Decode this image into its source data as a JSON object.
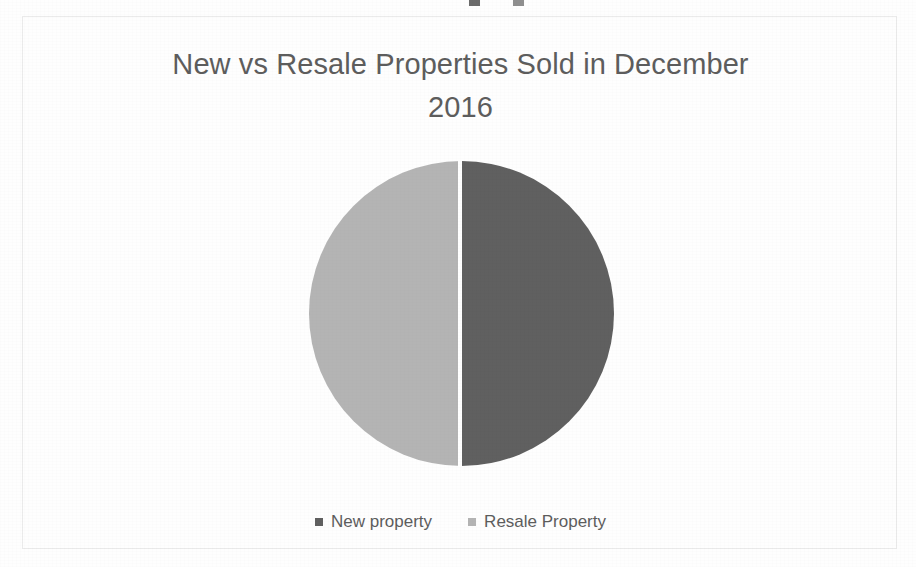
{
  "page": {
    "background_color": "#fefefe",
    "frame_border_color": "#ebebeb"
  },
  "top_cutoff": {
    "name": "cut-off-legend-markers",
    "markers": [
      {
        "color": "#6b6b6b",
        "left": 469
      },
      {
        "color": "#8f8f8f",
        "left": 513
      }
    ]
  },
  "chart_data": {
    "type": "pie",
    "title": "New vs Resale Properties Sold in December 2016",
    "title_lines": [
      "New vs Resale Properties Sold in December",
      "2016"
    ],
    "categories": [
      "New property",
      "Resale Property"
    ],
    "values": [
      50,
      50
    ],
    "value_unit": "percent",
    "colors": [
      "#606060",
      "#b4b4b4"
    ],
    "slices": [
      {
        "label": "New property",
        "value": 50,
        "color": "#606060",
        "position": "right-half"
      },
      {
        "label": "Resale Property",
        "value": 50,
        "color": "#b4b4b4",
        "position": "left-half"
      }
    ],
    "legend": {
      "position": "bottom",
      "entries": [
        {
          "label": "New property",
          "color": "#606060"
        },
        {
          "label": "Resale Property",
          "color": "#b4b4b4"
        }
      ]
    },
    "data_labels": false,
    "grid": false,
    "xlabel": "",
    "ylabel": "",
    "title_color": "#5d5d5d",
    "legend_text_color": "#5d5d5d"
  }
}
